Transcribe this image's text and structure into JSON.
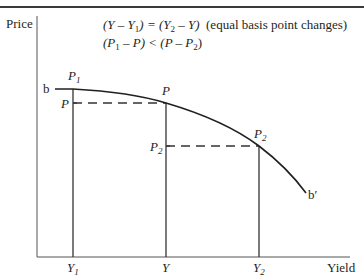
{
  "diagram": {
    "axes": {
      "y_label": "Price",
      "x_label": "Yield"
    },
    "curve": {
      "start_label": "b",
      "end_label": "b′"
    },
    "annotations": {
      "line1_expr": "(Y – Y",
      "line1_sub1": "1",
      "line1_mid": ") = (Y",
      "line1_sub2": "2",
      "line1_end": " – Y)",
      "line1_note": "(equal basis point changes)",
      "line2_open": "(P",
      "line2_sub1": "1",
      "line2_mid": " – P) < (P – P",
      "line2_sub2": "2",
      "line2_close": ")"
    },
    "points": [
      {
        "name": "P",
        "sub": "1",
        "curve_label": true
      },
      {
        "name": "P",
        "sub": "",
        "curve_label": true
      },
      {
        "name": "P",
        "sub": "2",
        "curve_label": true
      }
    ],
    "price_ticks": [
      {
        "name": "P",
        "sub": ""
      },
      {
        "name": "P",
        "sub": "2"
      }
    ],
    "yield_ticks": [
      {
        "name": "Y",
        "sub": "1"
      },
      {
        "name": "Y",
        "sub": ""
      },
      {
        "name": "Y",
        "sub": "2"
      }
    ]
  }
}
